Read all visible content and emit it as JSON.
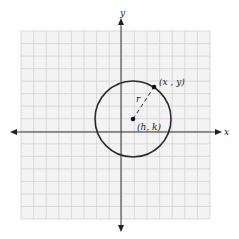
{
  "diagram": {
    "colors": {
      "background": "#ffffff",
      "grid_fill": "#f3f3f3",
      "grid_line": "#d2d2d2",
      "axis": "#333333",
      "circle": "#2a2a2a",
      "point": "#111111",
      "label": "#222222"
    },
    "grid": {
      "left": 21,
      "top": 31,
      "right": 210,
      "bottom": 219,
      "cells": 15
    },
    "axes": {
      "x_label": "x",
      "y_label": "y",
      "origin_px": [
        121,
        132
      ]
    },
    "circle": {
      "center_px": [
        133,
        119
      ],
      "radius_px": 38
    },
    "center_point": {
      "label": "(h, k)"
    },
    "edge_point": {
      "label": "(x , y)",
      "px": [
        154,
        87
      ]
    },
    "radius_label": "r"
  }
}
